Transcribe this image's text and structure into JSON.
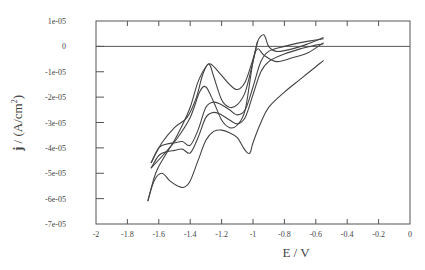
{
  "chart_data": {
    "type": "line",
    "title": "",
    "xlabel": "E / V",
    "ylabel": "j / (A/cm²)",
    "ylabel_bold_part": "j",
    "ylabel_rest": " / (A/cm",
    "ylabel_sup": "2",
    "ylabel_end": ")",
    "xlim": [
      -2,
      0
    ],
    "ylim": [
      -7e-05,
      1e-05
    ],
    "grid": false,
    "legend": null,
    "zero_line": true,
    "x_ticks": [
      -2,
      -1.8,
      -1.6,
      -1.4,
      -1.2,
      -1,
      -0.8,
      -0.6,
      -0.4,
      -0.2,
      0
    ],
    "x_tick_labels": [
      "-2",
      "-1.8",
      "-1.6",
      "-1.4",
      "-1.2",
      "-1",
      "-0.8",
      "-0.6",
      "-0.4",
      "-0.2",
      "0"
    ],
    "y_ticks": [
      1e-05,
      0,
      -1e-05,
      -2e-05,
      -3e-05,
      -4e-05,
      -5e-05,
      -6e-05,
      -7e-05
    ],
    "y_tick_labels": [
      "1e-05",
      "0",
      "-1e-05",
      "-2e-05",
      "-3e-05",
      "-4e-05",
      "-5e-05",
      "-6e-05",
      "-7e-05"
    ],
    "series_units_note": "j values below are in units of 1e-05 A/cm²",
    "series": [
      {
        "name": "scan 1 (upper branch)",
        "x": [
          -0.55,
          -0.65,
          -0.75,
          -0.85,
          -0.9,
          -0.93,
          -0.97,
          -1.0,
          -1.05,
          -1.1,
          -1.15,
          -1.2,
          -1.25,
          -1.28,
          -1.32,
          -1.36,
          -1.42,
          -1.5,
          -1.58,
          -1.65
        ],
        "y": [
          0.35,
          0.1,
          -0.1,
          -0.2,
          0.0,
          0.45,
          0.2,
          -0.6,
          -1.8,
          -2.3,
          -2.4,
          -2.1,
          -1.2,
          -0.7,
          -1.1,
          -2.0,
          -2.8,
          -3.2,
          -3.8,
          -4.6
        ]
      },
      {
        "name": "scan 2 (upper branch)",
        "x": [
          -0.55,
          -0.65,
          -0.75,
          -0.85,
          -0.93,
          -0.97,
          -1.0,
          -1.05,
          -1.1,
          -1.15,
          -1.2,
          -1.25,
          -1.3,
          -1.34,
          -1.4,
          -1.48,
          -1.56,
          -1.65
        ],
        "y": [
          0.15,
          -0.25,
          -0.45,
          -0.6,
          -0.35,
          -0.1,
          -0.6,
          -2.5,
          -3.1,
          -3.2,
          -2.9,
          -2.2,
          -1.6,
          -1.8,
          -2.8,
          -3.6,
          -4.2,
          -4.8
        ]
      },
      {
        "name": "scan 1 (lower branch)",
        "x": [
          -1.65,
          -1.6,
          -1.55,
          -1.5,
          -1.45,
          -1.4,
          -1.35,
          -1.3,
          -1.25,
          -1.2,
          -1.15,
          -1.1,
          -1.05,
          -1.0,
          -0.95,
          -0.9,
          -0.8,
          -0.7,
          -0.6,
          -0.55
        ],
        "y": [
          -4.6,
          -4.0,
          -3.85,
          -3.8,
          -3.75,
          -3.9,
          -3.3,
          -2.4,
          -2.2,
          -2.3,
          -2.5,
          -2.7,
          -2.5,
          -1.6,
          -0.6,
          -0.2,
          0.0,
          0.15,
          0.25,
          0.3
        ]
      },
      {
        "name": "scan 2 (lower branch)",
        "x": [
          -1.65,
          -1.6,
          -1.55,
          -1.5,
          -1.45,
          -1.4,
          -1.35,
          -1.3,
          -1.25,
          -1.2,
          -1.15,
          -1.1,
          -1.05,
          -1.0,
          -0.95,
          -0.9,
          -0.8,
          -0.7,
          -0.6,
          -0.55
        ],
        "y": [
          -4.8,
          -4.3,
          -4.15,
          -4.1,
          -4.05,
          -4.2,
          -3.6,
          -2.8,
          -2.6,
          -2.7,
          -2.9,
          -3.05,
          -2.8,
          -1.9,
          -1.0,
          -0.6,
          -0.3,
          -0.1,
          0.05,
          0.1
        ]
      },
      {
        "name": "scan 3 (outer lower)",
        "x": [
          -1.67,
          -1.63,
          -1.58,
          -1.53,
          -1.48,
          -1.44,
          -1.4,
          -1.35,
          -1.3,
          -1.25,
          -1.2,
          -1.15,
          -1.1,
          -1.05,
          -1.02,
          -1.0,
          -0.95,
          -0.9,
          -0.8,
          -0.7,
          -0.6,
          -0.55
        ],
        "y": [
          -6.1,
          -5.3,
          -5.0,
          -5.3,
          -5.5,
          -5.55,
          -5.3,
          -4.5,
          -3.7,
          -3.35,
          -3.3,
          -3.4,
          -3.6,
          -4.1,
          -4.2,
          -3.8,
          -3.0,
          -2.4,
          -1.8,
          -1.3,
          -0.8,
          -0.55
        ]
      },
      {
        "name": "scan 3 (outer upper)",
        "x": [
          -1.67,
          -1.62,
          -1.56,
          -1.5,
          -1.45,
          -1.4,
          -1.35,
          -1.3,
          -1.27,
          -1.22,
          -1.15,
          -1.1,
          -1.05,
          -1.0,
          -0.97
        ],
        "y": [
          -6.1,
          -5.0,
          -4.3,
          -3.7,
          -3.1,
          -2.4,
          -1.4,
          -0.8,
          -0.7,
          -1.0,
          -1.5,
          -1.7,
          -1.4,
          -0.5,
          0.2
        ]
      }
    ]
  }
}
